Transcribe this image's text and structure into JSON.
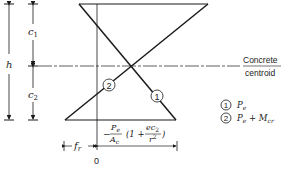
{
  "diagram": {
    "dimensions": {
      "h": "h",
      "c1": "c",
      "c1_sub": "1",
      "c2": "c",
      "c2_sub": "2"
    },
    "centroid_label_line1": "Concrete",
    "centroid_label_line2": "centroid",
    "origin_label": "0",
    "fr_label": "f",
    "fr_sub": "r",
    "stress_expression": {
      "minus": "−",
      "numerator": "P",
      "numerator_sub": "e",
      "denominator": "A",
      "denominator_sub": "c",
      "paren_open": "(1 +",
      "frac2_num": "ec",
      "frac2_num_sub": "2",
      "frac2_den": "r",
      "frac2_den_sup": "2",
      "paren_close": ")"
    },
    "markers": [
      {
        "id": "1",
        "label": "1"
      },
      {
        "id": "2",
        "label": "2"
      }
    ],
    "legend": [
      {
        "marker": "1",
        "text": "P",
        "sub": "e",
        "extra": ""
      },
      {
        "marker": "2",
        "text": "P",
        "sub": "e",
        "extra": " + M",
        "extra_sub": "cr"
      }
    ]
  }
}
